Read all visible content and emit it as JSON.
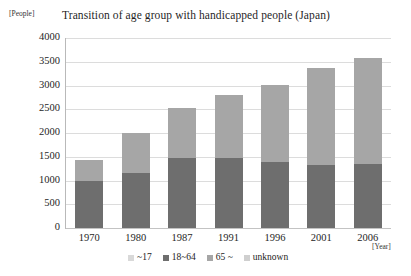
{
  "chart_data": {
    "type": "bar",
    "subtype": "stacked-vertical",
    "title": "Transition of age group with handicapped people (Japan)",
    "xlabel": "[Year]",
    "ylabel": "[People]",
    "categories": [
      "1970",
      "1980",
      "1987",
      "1991",
      "1996",
      "2001",
      "2006"
    ],
    "ylim": [
      0,
      4000
    ],
    "yticks": [
      4000,
      3500,
      3000,
      2500,
      2000,
      1500,
      1000,
      500,
      0
    ],
    "ytick_labels": [
      "4000",
      "3500",
      "3000",
      "2500",
      "2000",
      "1500",
      "1000",
      "500",
      "0"
    ],
    "grid": true,
    "legend_position": "bottom",
    "series": [
      {
        "name": "~17",
        "color": "#d9d9d9",
        "values": [
          0,
          0,
          0,
          0,
          0,
          0,
          0
        ]
      },
      {
        "name": "18~64",
        "color": "#6e6e6e",
        "values": [
          1000,
          1150,
          1480,
          1480,
          1380,
          1320,
          1350
        ]
      },
      {
        "name": "65 ~",
        "color": "#a6a6a6",
        "values": [
          430,
          850,
          1050,
          1330,
          1630,
          2040,
          2230
        ]
      },
      {
        "name": "unknown",
        "color": "#cfcfcf",
        "values": [
          0,
          0,
          0,
          0,
          0,
          0,
          0
        ]
      }
    ],
    "totals": [
      1430,
      2000,
      2530,
      2810,
      3010,
      3360,
      3580
    ]
  }
}
